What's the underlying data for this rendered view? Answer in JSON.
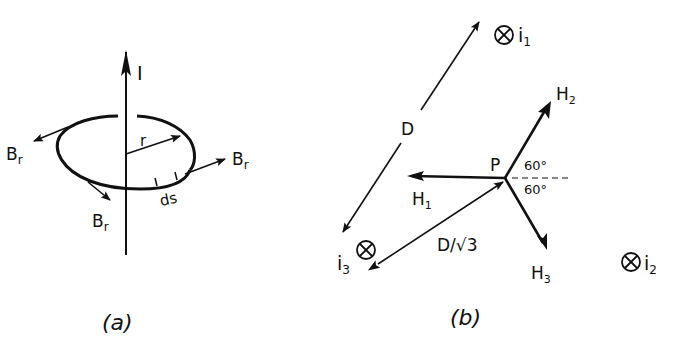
{
  "panel_a": {
    "current_label": "I",
    "radius_label": "r",
    "element_label": "ds",
    "field_label": "B",
    "field_subscript": "r",
    "caption": "(a)"
  },
  "panel_b": {
    "point_label": "P",
    "distance_label": "D",
    "distance_to_p_label": "D/√3",
    "angle_upper": "60°",
    "angle_lower": "60°",
    "h1": {
      "base": "H",
      "sub": "1"
    },
    "h2": {
      "base": "H",
      "sub": "2"
    },
    "h3": {
      "base": "H",
      "sub": "3"
    },
    "i1": {
      "base": "i",
      "sub": "1"
    },
    "i2": {
      "base": "i",
      "sub": "2"
    },
    "i3": {
      "base": "i",
      "sub": "3"
    },
    "caption": "(b)"
  }
}
